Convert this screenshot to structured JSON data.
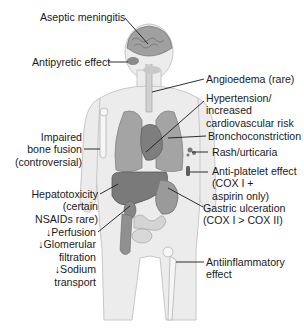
{
  "diagram": {
    "labels": {
      "aseptic_meningitis": "Aseptic meningitis",
      "antipyretic": "Antipyretic effect",
      "angioedema": "Angioedema (rare)",
      "hypertension": [
        "Hypertension/",
        "increased",
        "cardiovascular risk"
      ],
      "bronchoconstriction": "Bronchoconstriction",
      "rash": "Rash/urticaria",
      "antiplatelet": [
        "Anti-platelet effect",
        "(COX I +",
        "aspirin only)"
      ],
      "bone_fusion": [
        "Impaired",
        "bone fusion",
        "(controversial)"
      ],
      "hepatotoxicity": [
        "Hepatotoxicity",
        "(certain",
        "NSAIDs rare)"
      ],
      "renal": [
        "↓Perfusion",
        "↓Glomerular",
        "filtration",
        "↓Sodium",
        "transport"
      ],
      "gastric": [
        "Gastric ulceration",
        "(COX I > COX II)"
      ],
      "antiinflammatory": [
        "Antiinflammatory",
        "effect"
      ]
    },
    "colors": {
      "body": "#ececec",
      "body_outline": "#c8c8c8",
      "organ": "#8e8e8e",
      "organ_dark": "#6e6e6e",
      "brain": "#9a9a9a",
      "leader": "#1a1a1a"
    }
  }
}
